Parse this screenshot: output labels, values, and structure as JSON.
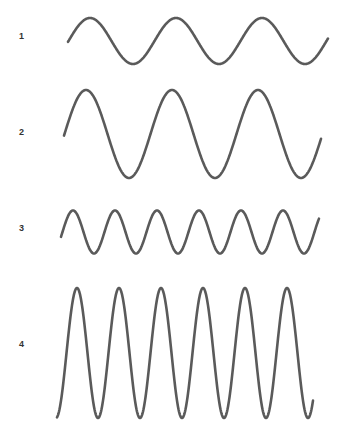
{
  "diagram": {
    "stroke_color": "#5a5a5a",
    "stroke_width": 2.6,
    "waves": [
      {
        "label": "1",
        "label_pos": {
          "x": 19,
          "y": 32
        },
        "description": "low amplitude, low frequency",
        "x_start": 68,
        "x_end": 328,
        "center_y": 41,
        "amplitude": 23,
        "period": 86,
        "first_peak_x": 90,
        "start_y": 39,
        "end_y": 40
      },
      {
        "label": "2",
        "label_pos": {
          "x": 19,
          "y": 128
        },
        "description": "high amplitude, low frequency",
        "x_start": 64,
        "x_end": 321,
        "center_y": 134,
        "amplitude": 44,
        "period": 86,
        "first_peak_x": 86,
        "start_y": 129,
        "end_y": 137
      },
      {
        "label": "3",
        "label_pos": {
          "x": 19,
          "y": 224
        },
        "description": "low amplitude, high frequency",
        "x_start": 61,
        "x_end": 319,
        "center_y": 232,
        "amplitude": 21.5,
        "period": 42,
        "first_peak_x": 73,
        "start_y": 231,
        "end_y": 234
      },
      {
        "label": "4",
        "label_pos": {
          "x": 19,
          "y": 340
        },
        "description": "high amplitude, high frequency",
        "x_start": 57,
        "x_end": 313,
        "center_y": 353,
        "amplitude": 65,
        "period": 42,
        "first_peak_x": 77,
        "start_y": 349,
        "end_y": 352
      }
    ]
  }
}
